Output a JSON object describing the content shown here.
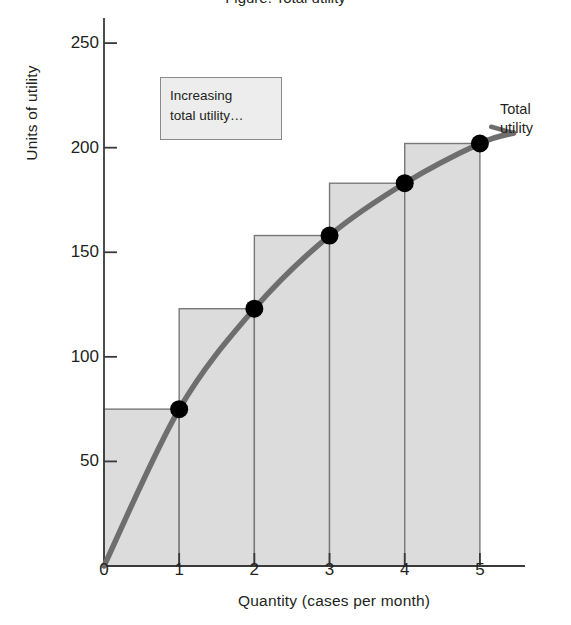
{
  "figure": {
    "title": "Figure: Total utility",
    "y_axis_label": "Units of utility",
    "x_axis_label": "Quantity (cases per month)",
    "curve_label_line1": "Total",
    "curve_label_line2": "utility",
    "callout_line1": "Increasing",
    "callout_line2": "total utility…",
    "colors": {
      "bar_fill": "#dcdcdc",
      "bar_stroke": "#787878",
      "curve": "#6e6e6e",
      "point": "#000000",
      "axis": "#3a3a3a",
      "text": "#231f20",
      "callout_fill": "#ededed",
      "callout_stroke": "#8a8a8a"
    }
  },
  "chart_data": {
    "type": "line",
    "title": "Total utility",
    "xlabel": "Quantity (cases per month)",
    "ylabel": "Units of utility",
    "xlim": [
      0,
      5.6
    ],
    "ylim": [
      0,
      262
    ],
    "xticks": [
      0,
      1,
      2,
      3,
      4,
      5
    ],
    "xtick_labels": [
      "0",
      "1",
      "2",
      "3",
      "4",
      "5"
    ],
    "yticks": [
      50,
      100,
      150,
      200,
      250
    ],
    "ytick_labels": [
      "50",
      "100",
      "150",
      "200",
      "250"
    ],
    "grid": false,
    "legend": "none",
    "annotations": [
      {
        "text": "Increasing total utility…",
        "type": "callout-box",
        "x": 1.0,
        "y": 240
      },
      {
        "text": "Total utility",
        "type": "series-label",
        "x": 5.5,
        "y": 215
      }
    ],
    "series": [
      {
        "name": "Total utility",
        "type": "line",
        "x": [
          0,
          1,
          2,
          3,
          4,
          5
        ],
        "values": [
          0,
          75,
          123,
          158,
          183,
          202
        ],
        "markers": true,
        "marker_x": [
          1,
          2,
          3,
          4,
          5
        ],
        "marker_values": [
          75,
          123,
          158,
          183,
          202
        ]
      },
      {
        "name": "Total utility step bars",
        "type": "step-bar",
        "categories": [
          "0–1",
          "1–2",
          "2–3",
          "3–4",
          "4–5"
        ],
        "bar_x_start": [
          0,
          1,
          2,
          3,
          4
        ],
        "bar_x_end": [
          1,
          2,
          3,
          4,
          5
        ],
        "values": [
          75,
          123,
          158,
          183,
          202
        ]
      }
    ],
    "marginal_utility": [
      75,
      48,
      35,
      25,
      19
    ]
  }
}
